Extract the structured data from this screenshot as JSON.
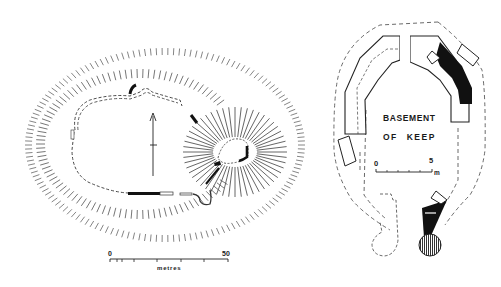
{
  "site_plan": {
    "scale_bar": {
      "start_label": "0",
      "end_label": "50",
      "unit_label": "metres"
    },
    "north_arrow": "north-arrow"
  },
  "keep_plan": {
    "title_line1": "BASEMENT",
    "title_line2": "OF KEEP",
    "scale_bar": {
      "start_label": "0",
      "end_label": "5",
      "unit_label": "m"
    }
  },
  "colors": {
    "ink": "#1a1a1a",
    "hachure": "#6a6a6a",
    "paper": "#ffffff"
  }
}
